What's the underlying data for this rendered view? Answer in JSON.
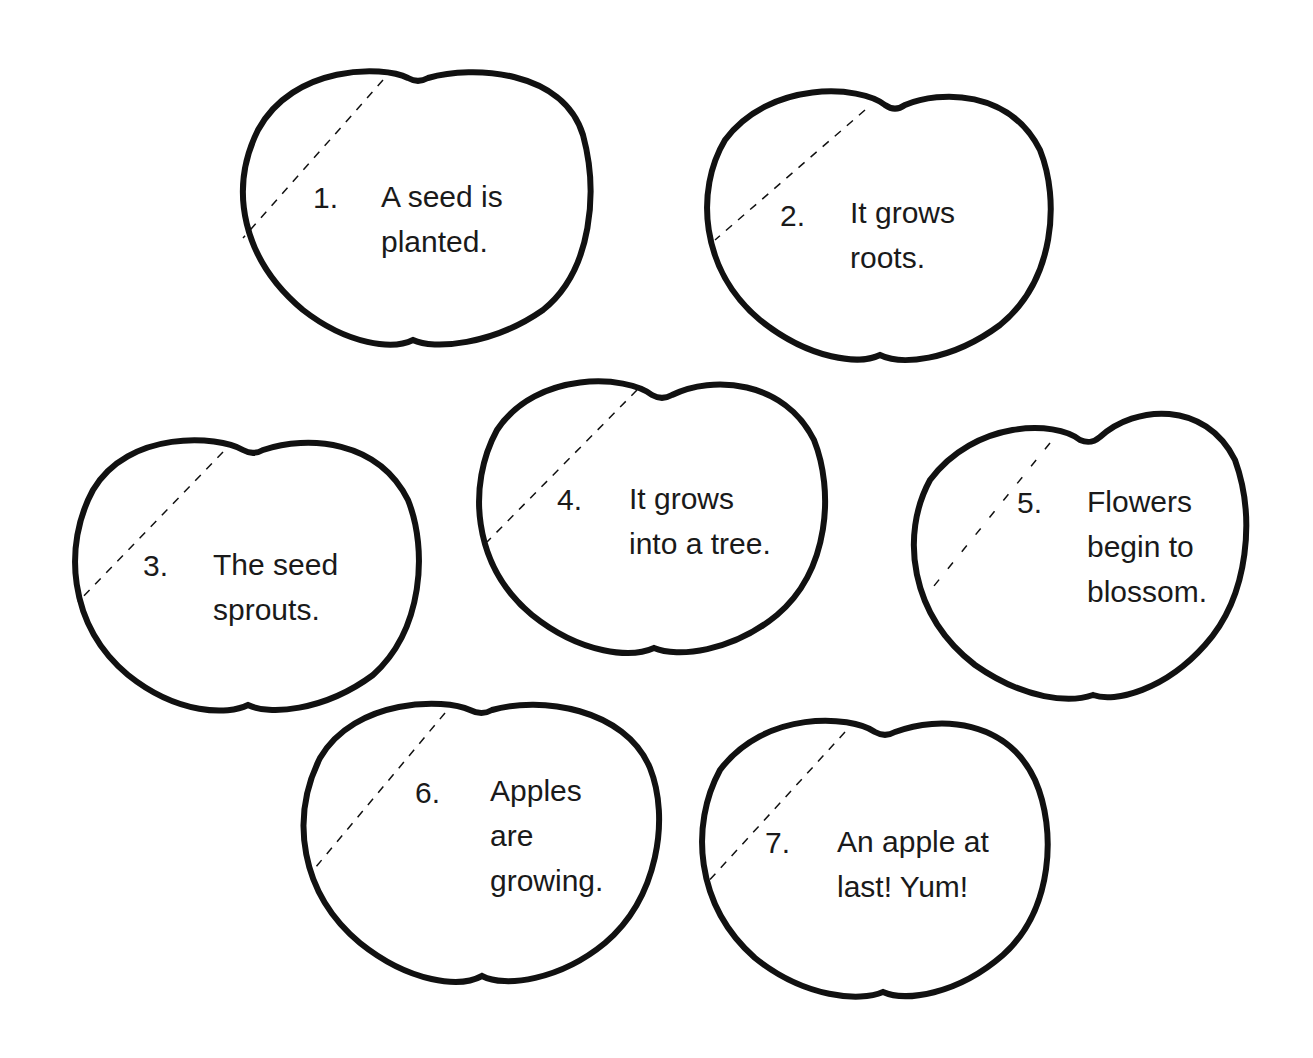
{
  "worksheet": {
    "apples": [
      {
        "number": "1.",
        "lines": [
          "A seed is",
          "planted."
        ]
      },
      {
        "number": "2.",
        "lines": [
          "It grows",
          "roots."
        ]
      },
      {
        "number": "3.",
        "lines": [
          "The seed",
          "sprouts."
        ]
      },
      {
        "number": "4.",
        "lines": [
          "It grows",
          "into a tree."
        ]
      },
      {
        "number": "5.",
        "lines": [
          "Flowers",
          "begin to",
          "blossom."
        ]
      },
      {
        "number": "6.",
        "lines": [
          "Apples",
          "are",
          "growing."
        ]
      },
      {
        "number": "7.",
        "lines": [
          "An apple at",
          "last! Yum!"
        ]
      }
    ]
  },
  "colors": {
    "outline": "#111111",
    "text": "#1a1a1a",
    "background": "#ffffff"
  }
}
